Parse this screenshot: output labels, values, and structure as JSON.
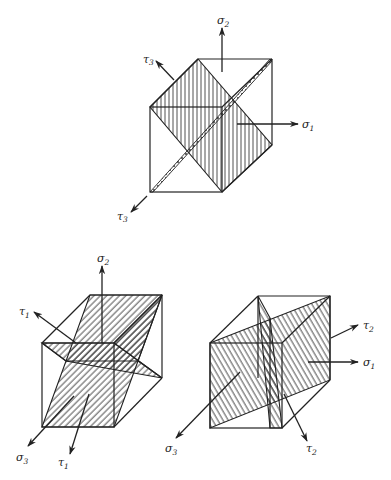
{
  "figure": {
    "colors": {
      "line": "#222222",
      "background": "#ffffff"
    },
    "panels": [
      {
        "id": "top",
        "labels": {
          "sigma_up": {
            "sym": "σ",
            "sub": "2"
          },
          "sigma_right": {
            "sym": "σ",
            "sub": "1"
          },
          "tau_upper": {
            "sym": "τ",
            "sub": "3"
          },
          "tau_lower": {
            "sym": "τ",
            "sub": "3"
          }
        },
        "hatching": "vertical"
      },
      {
        "id": "bottom-left",
        "labels": {
          "sigma_up": {
            "sym": "σ",
            "sub": "2"
          },
          "tau_upper": {
            "sym": "τ",
            "sub": "1"
          },
          "sigma_front": {
            "sym": "σ",
            "sub": "3"
          },
          "tau_lower": {
            "sym": "τ",
            "sub": "1"
          }
        },
        "hatching": "diagonal-backslash"
      },
      {
        "id": "bottom-right",
        "labels": {
          "tau_upper": {
            "sym": "τ",
            "sub": "2"
          },
          "sigma_right": {
            "sym": "σ",
            "sub": "1"
          },
          "sigma_front": {
            "sym": "σ",
            "sub": "3"
          },
          "tau_lower": {
            "sym": "τ",
            "sub": "2"
          }
        },
        "hatching": "diagonal-slash"
      }
    ]
  }
}
